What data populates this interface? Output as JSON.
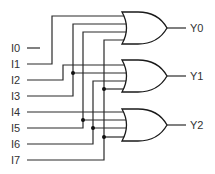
{
  "diagram": {
    "inputs": [
      {
        "label": "I0",
        "y": 48
      },
      {
        "label": "I1",
        "y": 64
      },
      {
        "label": "I2",
        "y": 80
      },
      {
        "label": "I3",
        "y": 96
      },
      {
        "label": "I4",
        "y": 112
      },
      {
        "label": "I5",
        "y": 128
      },
      {
        "label": "I6",
        "y": 144
      },
      {
        "label": "I7",
        "y": 160
      }
    ],
    "outputs": [
      {
        "label": "Y0",
        "gate": "OR",
        "inputs": [
          "I1",
          "I3",
          "I5",
          "I7"
        ]
      },
      {
        "label": "Y1",
        "gate": "OR",
        "inputs": [
          "I2",
          "I3",
          "I6",
          "I7"
        ]
      },
      {
        "label": "Y2",
        "gate": "OR",
        "inputs": [
          "I4",
          "I5",
          "I6",
          "I7"
        ]
      }
    ]
  }
}
